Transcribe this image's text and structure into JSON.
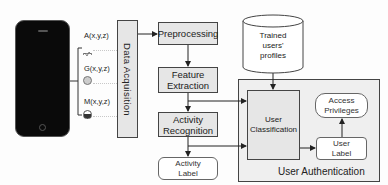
{
  "diagram": {
    "phone": {
      "label": ""
    },
    "sensors": [
      {
        "label": "A(x,y,z)",
        "icon": "accelerometer-icon"
      },
      {
        "label": "G(x,y,z)",
        "icon": "gyroscope-icon"
      },
      {
        "label": "M(x,y,z)",
        "icon": "magnetometer-icon"
      }
    ],
    "data_acquisition": "Data Acquisition",
    "preprocessing": "Preprocessing",
    "feature_extraction": [
      "Feature",
      "Extraction"
    ],
    "activity_recognition": [
      "Activity",
      "Recognition"
    ],
    "activity_label": [
      "Activity",
      "Label"
    ],
    "trained_profiles": [
      "Trained",
      "users'",
      "profiles"
    ],
    "user_classification": [
      "User",
      "Classification"
    ],
    "access_privileges": [
      "Access",
      "Privileges"
    ],
    "user_label": [
      "User",
      "Label"
    ],
    "user_authentication": "User Authentication",
    "colors": {
      "box_fill": "#e6e6e6",
      "outer_fill": "#efefef",
      "stroke": "#444444",
      "phone": "#0a0a0a"
    }
  }
}
